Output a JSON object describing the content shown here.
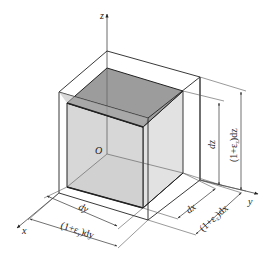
{
  "figure": {
    "colors": {
      "stroke": "#222222",
      "thin_stroke": "#444444",
      "inner_top_face": "#9a9a9a",
      "inner_front_face": "#d2d2d2",
      "inner_side_face": "#e0e0e0",
      "inner_bottom_face": "#d8d8d8",
      "outer_band": "#b0b0b0"
    }
  },
  "axes": {
    "x": "x",
    "y": "y",
    "z": "z",
    "origin": "O"
  },
  "dimensions": {
    "dy": "dy",
    "dy_deformed": "(1+ε",
    "dy_deformed_sub": "y",
    "dy_deformed_tail": ")dy",
    "dx": "dx",
    "dx_deformed": "(1+ε",
    "dx_deformed_sub": "x",
    "dx_deformed_tail": ")dx",
    "dz": "dz",
    "dz_deformed": "(1+ε",
    "dz_deformed_sub": "z",
    "dz_deformed_tail": ")dz"
  }
}
